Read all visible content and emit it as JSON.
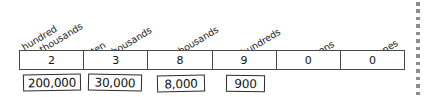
{
  "worksheet": {
    "title": "Place value chart for 238,900",
    "place_value_table": {
      "columns": [
        {
          "header_line1": "hundred",
          "header_line2": "thousands",
          "digit": "2"
        },
        {
          "header_line1": "ten",
          "header_line2": "thousands",
          "digit": "3"
        },
        {
          "header_line1": "thousands",
          "header_line2": "",
          "digit": "8"
        },
        {
          "header_line1": "hundreds",
          "header_line2": "",
          "digit": "9"
        },
        {
          "header_line1": "tens",
          "header_line2": "",
          "digit": "0"
        },
        {
          "header_line1": "ones",
          "header_line2": "",
          "digit": "0"
        }
      ]
    },
    "expanded_form_boxes": [
      {
        "value": "200,000"
      },
      {
        "value": "30,000"
      },
      {
        "value": "8,000"
      },
      {
        "value": "900"
      }
    ],
    "colors": {
      "ink": "#111111",
      "rule": "#4a4a4a",
      "box_border": "#2b2b2b",
      "dotted_rule": "#8d8d8d",
      "page_background": "#ffffff"
    },
    "dotted_rule": {
      "dot_count": 13
    }
  }
}
